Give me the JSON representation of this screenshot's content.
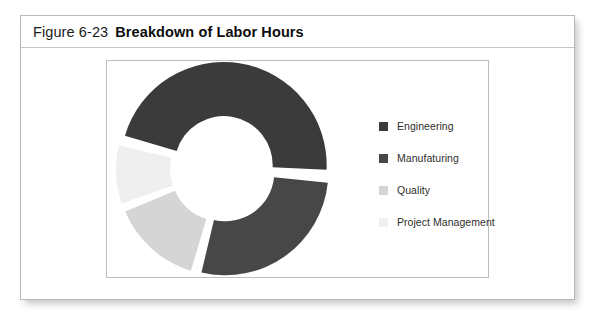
{
  "figure": {
    "caption_number": "Figure 6-23",
    "caption_title": "Breakdown of Labor Hours"
  },
  "chart_data": {
    "type": "pie",
    "variant": "donut",
    "title": "Breakdown of Labor Hours",
    "xlabel": "",
    "ylabel": "",
    "legend_position": "right",
    "grid": false,
    "exploded": true,
    "categories": [
      "Engineering",
      "Manufaturing",
      "Quality",
      "Project Management"
    ],
    "values": [
      47,
      28,
      15,
      10
    ],
    "units": "percent",
    "colors": [
      "#3b3b3b",
      "#474747",
      "#d5d5d5",
      "#efefef"
    ],
    "slices": [
      {
        "label": "Engineering",
        "value": 47,
        "color": "#3b3b3b"
      },
      {
        "label": "Manufaturing",
        "value": 28,
        "color": "#474747"
      },
      {
        "label": "Quality",
        "value": 15,
        "color": "#d5d5d5"
      },
      {
        "label": "Project Management",
        "value": 10,
        "color": "#efefef"
      }
    ]
  },
  "legend": {
    "items": [
      {
        "label": "Engineering",
        "color": "#3b3b3b"
      },
      {
        "label": "Manufaturing",
        "color": "#474747"
      },
      {
        "label": "Quality",
        "color": "#d5d5d5"
      },
      {
        "label": "Project Management",
        "color": "#efefef"
      }
    ]
  }
}
